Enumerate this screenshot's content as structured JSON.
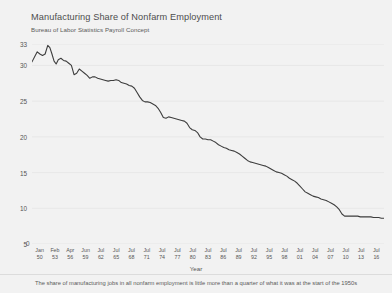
{
  "header": {
    "title": "Manufacturing Share of Nonfarm Employment",
    "subtitle": "Bureau of Labor Statistics Payroll Concept"
  },
  "footer": {
    "caption": "The share of manufacturing jobs in all nonfarm employment is little more than a quarter of what it was at the start of the 1950s"
  },
  "axis": {
    "zero_label": "0",
    "x_title": "Year"
  },
  "colors": {
    "background": "#f2f2f2",
    "line": "#3d3d3d",
    "grid": "#e2e2e2",
    "text": "#555555"
  },
  "chart_data": {
    "type": "line",
    "title": "Manufacturing Share of Nonfarm Employment",
    "subtitle": "Bureau of Labor Statistics Payroll Concept",
    "xlabel": "Year",
    "ylabel": "",
    "ylim": [
      5,
      33
    ],
    "yticks": [
      5,
      10,
      15,
      20,
      25,
      30,
      33
    ],
    "ytick_labels": [
      "5",
      "10",
      "15",
      "20",
      "25",
      "30",
      "33"
    ],
    "grid": true,
    "legend": "none",
    "xtick_labels": [
      {
        "month": "Jan",
        "year": "50"
      },
      {
        "month": "Feb",
        "year": "53"
      },
      {
        "month": "Apr",
        "year": "56"
      },
      {
        "month": "Jun",
        "year": "59"
      },
      {
        "month": "Jul",
        "year": "62"
      },
      {
        "month": "Jul",
        "year": "65"
      },
      {
        "month": "Jul",
        "year": "68"
      },
      {
        "month": "Jul",
        "year": "71"
      },
      {
        "month": "Jul",
        "year": "74"
      },
      {
        "month": "Jul",
        "year": "77"
      },
      {
        "month": "Jul",
        "year": "80"
      },
      {
        "month": "Jul",
        "year": "83"
      },
      {
        "month": "Jul",
        "year": "86"
      },
      {
        "month": "Jul",
        "year": "89"
      },
      {
        "month": "Jul",
        "year": "92"
      },
      {
        "month": "Jul",
        "year": "95"
      },
      {
        "month": "Jul",
        "year": "98"
      },
      {
        "month": "Jul",
        "year": "01"
      },
      {
        "month": "Jul",
        "year": "04"
      },
      {
        "month": "Jul",
        "year": "07"
      },
      {
        "month": "Jul",
        "year": "10"
      },
      {
        "month": "Jul",
        "year": "13"
      },
      {
        "month": "Jul",
        "year": "16"
      }
    ],
    "x_start_year": 1950.0,
    "x_end_year": 2017.0,
    "series": [
      {
        "name": "Manufacturing share of nonfarm employment",
        "x": [
          1950.0,
          1950.5,
          1951.0,
          1951.5,
          1952.0,
          1952.5,
          1953.0,
          1953.4,
          1953.8,
          1954.2,
          1954.6,
          1955.0,
          1955.5,
          1956.0,
          1956.5,
          1957.0,
          1957.5,
          1958.0,
          1958.5,
          1959.0,
          1959.5,
          1960.0,
          1960.5,
          1961.0,
          1961.5,
          1962.0,
          1962.5,
          1963.0,
          1963.5,
          1964.0,
          1964.5,
          1965.0,
          1965.5,
          1966.0,
          1966.5,
          1967.0,
          1967.5,
          1968.0,
          1968.5,
          1969.0,
          1969.5,
          1970.0,
          1970.5,
          1971.0,
          1971.5,
          1972.0,
          1972.5,
          1973.0,
          1973.5,
          1974.0,
          1974.5,
          1975.0,
          1975.5,
          1976.0,
          1976.5,
          1977.0,
          1977.5,
          1978.0,
          1978.5,
          1979.0,
          1979.5,
          1980.0,
          1980.5,
          1981.0,
          1981.5,
          1982.0,
          1982.5,
          1983.0,
          1983.5,
          1984.0,
          1984.5,
          1985.0,
          1985.5,
          1986.0,
          1986.5,
          1987.0,
          1987.5,
          1988.0,
          1988.5,
          1989.0,
          1989.5,
          1990.0,
          1990.5,
          1991.0,
          1991.5,
          1992.0,
          1992.5,
          1993.0,
          1993.5,
          1994.0,
          1994.5,
          1995.0,
          1995.5,
          1996.0,
          1996.5,
          1997.0,
          1997.5,
          1998.0,
          1998.5,
          1999.0,
          1999.5,
          2000.0,
          2000.5,
          2001.0,
          2001.5,
          2002.0,
          2002.5,
          2003.0,
          2003.5,
          2004.0,
          2004.5,
          2005.0,
          2005.5,
          2006.0,
          2006.5,
          2007.0,
          2007.5,
          2008.0,
          2008.5,
          2009.0,
          2009.5,
          2010.0,
          2010.5,
          2011.0,
          2011.5,
          2012.0,
          2012.5,
          2013.0,
          2013.5,
          2014.0,
          2014.5,
          2015.0,
          2015.5,
          2016.0,
          2016.5,
          2017.0
        ],
        "values": [
          30.5,
          31.2,
          31.9,
          31.6,
          31.4,
          31.6,
          32.8,
          32.5,
          31.6,
          30.6,
          30.2,
          30.8,
          31.0,
          30.7,
          30.6,
          30.3,
          30.0,
          28.7,
          28.9,
          29.5,
          29.2,
          28.9,
          28.6,
          28.2,
          28.4,
          28.4,
          28.2,
          28.1,
          28.0,
          27.9,
          27.8,
          27.9,
          27.9,
          28.0,
          27.9,
          27.6,
          27.5,
          27.4,
          27.2,
          27.1,
          26.8,
          26.2,
          25.6,
          25.1,
          24.9,
          24.9,
          24.8,
          24.6,
          24.4,
          24.0,
          23.4,
          22.7,
          22.6,
          22.8,
          22.7,
          22.6,
          22.5,
          22.4,
          22.3,
          22.2,
          21.9,
          21.3,
          21.0,
          20.9,
          20.6,
          20.0,
          19.7,
          19.7,
          19.6,
          19.6,
          19.4,
          19.2,
          18.9,
          18.7,
          18.5,
          18.4,
          18.2,
          18.1,
          18.0,
          17.8,
          17.6,
          17.3,
          17.0,
          16.7,
          16.5,
          16.4,
          16.3,
          16.2,
          16.1,
          16.0,
          15.9,
          15.7,
          15.5,
          15.3,
          15.1,
          15.0,
          14.9,
          14.7,
          14.5,
          14.2,
          14.0,
          13.8,
          13.5,
          13.1,
          12.7,
          12.3,
          12.1,
          11.9,
          11.7,
          11.6,
          11.5,
          11.3,
          11.2,
          11.1,
          10.9,
          10.7,
          10.5,
          10.2,
          9.8,
          9.2,
          8.9,
          8.9,
          8.9,
          8.9,
          8.9,
          8.9,
          8.8,
          8.8,
          8.8,
          8.8,
          8.8,
          8.7,
          8.7,
          8.7,
          8.6,
          8.6
        ]
      }
    ]
  }
}
